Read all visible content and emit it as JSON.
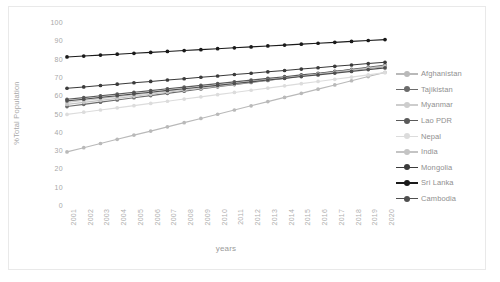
{
  "chart_data": {
    "type": "line",
    "title": "",
    "xlabel": "years",
    "ylabel": "%Total Population",
    "ylim": [
      0,
      100
    ],
    "ytick_step": 10,
    "yticks": [
      100,
      90,
      80,
      70,
      60,
      50,
      40,
      30,
      20,
      10,
      0
    ],
    "grid": false,
    "legend_position": "right",
    "categories": [
      "2001",
      "2002",
      "2003",
      "2004",
      "2005",
      "2006",
      "2007",
      "2008",
      "2009",
      "2010",
      "2011",
      "2012",
      "2013",
      "2014",
      "2015",
      "2016",
      "2017",
      "2018",
      "2019",
      "2020"
    ],
    "series": [
      {
        "name": "Afghanistan",
        "color": "#b9b9b9",
        "values": [
          29.0,
          31.3,
          33.6,
          35.9,
          38.2,
          40.4,
          42.7,
          45.0,
          47.3,
          49.6,
          51.9,
          54.2,
          56.5,
          58.8,
          61.0,
          63.3,
          65.6,
          67.9,
          70.2,
          72.5
        ]
      },
      {
        "name": "Tajikistan",
        "color": "#6b6b6b",
        "values": [
          53.8,
          55.0,
          56.2,
          57.4,
          58.6,
          59.8,
          61.0,
          62.2,
          63.4,
          64.6,
          65.8,
          67.0,
          68.1,
          69.3,
          70.5,
          71.7,
          72.9,
          74.1,
          75.3,
          76.5
        ]
      },
      {
        "name": "Myanmar",
        "color": "#cdcdcd",
        "values": [
          56.1,
          57.1,
          58.1,
          59.2,
          60.2,
          61.2,
          62.3,
          63.3,
          64.3,
          65.4,
          66.4,
          67.4,
          68.5,
          69.5,
          70.5,
          71.6,
          72.6,
          73.6,
          74.7,
          75.7
        ]
      },
      {
        "name": "Lao PDR",
        "color": "#5a5a5a",
        "values": [
          57.8,
          58.7,
          59.7,
          60.6,
          61.6,
          62.5,
          63.5,
          64.4,
          65.4,
          66.3,
          67.3,
          68.2,
          69.2,
          70.1,
          71.1,
          72.0,
          73.0,
          73.9,
          74.9,
          75.8
        ]
      },
      {
        "name": "Nepal",
        "color": "#dcdcdc",
        "values": [
          49.5,
          50.7,
          51.9,
          53.1,
          54.3,
          55.5,
          56.7,
          57.9,
          59.1,
          60.3,
          61.5,
          62.7,
          63.9,
          65.1,
          66.3,
          67.5,
          68.7,
          69.9,
          71.1,
          72.3
        ]
      },
      {
        "name": "India",
        "color": "#c4c4c4",
        "values": [
          55.0,
          56.1,
          57.2,
          58.3,
          59.4,
          60.5,
          61.6,
          62.7,
          63.8,
          64.9,
          66.0,
          67.1,
          68.2,
          69.3,
          70.4,
          71.5,
          72.6,
          73.7,
          74.8,
          75.9
        ]
      },
      {
        "name": "Mongolia",
        "color": "#3b3b3b",
        "values": [
          63.8,
          64.5,
          65.3,
          66.0,
          66.8,
          67.5,
          68.3,
          69.0,
          69.8,
          70.5,
          71.3,
          72.0,
          72.8,
          73.5,
          74.3,
          75.0,
          75.8,
          76.5,
          77.3,
          78.0
        ]
      },
      {
        "name": "Sri Lanka",
        "color": "#1a1a1a",
        "values": [
          80.9,
          81.4,
          81.9,
          82.4,
          82.9,
          83.4,
          83.9,
          84.4,
          84.9,
          85.4,
          85.9,
          86.4,
          86.9,
          87.4,
          87.9,
          88.4,
          88.9,
          89.4,
          89.9,
          90.4
        ]
      },
      {
        "name": "Cambodia",
        "color": "#4f4f4f",
        "values": [
          56.9,
          57.8,
          58.8,
          59.7,
          60.7,
          61.6,
          62.6,
          63.5,
          64.5,
          65.4,
          66.4,
          67.3,
          68.3,
          69.2,
          70.2,
          71.1,
          72.1,
          73.0,
          74.0,
          74.9
        ]
      }
    ]
  },
  "legend": {
    "items": [
      {
        "label": "Afghanistan"
      },
      {
        "label": "Tajikistan"
      },
      {
        "label": "Myanmar"
      },
      {
        "label": "Lao PDR"
      },
      {
        "label": "Nepal"
      },
      {
        "label": "India"
      },
      {
        "label": "Mongolia"
      },
      {
        "label": "Sri Lanka"
      },
      {
        "label": "Cambodia"
      }
    ]
  }
}
